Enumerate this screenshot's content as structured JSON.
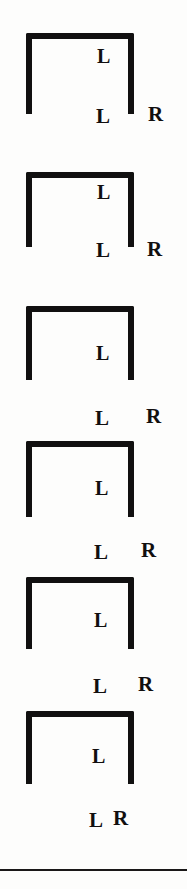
{
  "figure": {
    "background_color": "#fdfdfc",
    "ink_color": "#111010",
    "panel_count": 6,
    "panels": [
      {
        "index": 1,
        "bracket": {
          "x": 26,
          "y": 33,
          "width": 108,
          "height": 81,
          "stroke": 6
        },
        "inner_label": {
          "text": "L",
          "x": 97,
          "y": 46
        },
        "bottom_labels": [
          {
            "text": "L",
            "x": 96,
            "y": 106
          },
          {
            "text": "R",
            "x": 148,
            "y": 104
          }
        ]
      },
      {
        "index": 2,
        "bracket": {
          "x": 26,
          "y": 172,
          "width": 108,
          "height": 75,
          "stroke": 6
        },
        "inner_label": {
          "text": "L",
          "x": 97,
          "y": 182
        },
        "bottom_labels": [
          {
            "text": "L",
            "x": 96,
            "y": 240
          },
          {
            "text": "R",
            "x": 147,
            "y": 239
          }
        ]
      },
      {
        "index": 3,
        "bracket": {
          "x": 26,
          "y": 306,
          "width": 108,
          "height": 74,
          "stroke": 6
        },
        "inner_label": {
          "text": "L",
          "x": 96,
          "y": 343
        },
        "bottom_labels": [
          {
            "text": "L",
            "x": 95,
            "y": 408
          },
          {
            "text": "R",
            "x": 146,
            "y": 406
          }
        ]
      },
      {
        "index": 4,
        "bracket": {
          "x": 26,
          "y": 441,
          "width": 108,
          "height": 76,
          "stroke": 6
        },
        "inner_label": {
          "text": "L",
          "x": 95,
          "y": 478
        },
        "bottom_labels": [
          {
            "text": "L",
            "x": 94,
            "y": 542
          },
          {
            "text": "R",
            "x": 141,
            "y": 540
          }
        ]
      },
      {
        "index": 5,
        "bracket": {
          "x": 26,
          "y": 577,
          "width": 108,
          "height": 72,
          "stroke": 6
        },
        "inner_label": {
          "text": "L",
          "x": 94,
          "y": 610
        },
        "bottom_labels": [
          {
            "text": "L",
            "x": 93,
            "y": 676
          },
          {
            "text": "R",
            "x": 138,
            "y": 674
          }
        ]
      },
      {
        "index": 6,
        "bracket": {
          "x": 26,
          "y": 711,
          "width": 108,
          "height": 73,
          "stroke": 6
        },
        "inner_label": {
          "text": "L",
          "x": 92,
          "y": 746
        },
        "bottom_labels": [
          {
            "text": "L",
            "x": 89,
            "y": 810
          },
          {
            "text": "R",
            "x": 113,
            "y": 808
          }
        ]
      }
    ],
    "rule": {
      "y": 869,
      "height": 2,
      "color": "#1a1818"
    }
  }
}
